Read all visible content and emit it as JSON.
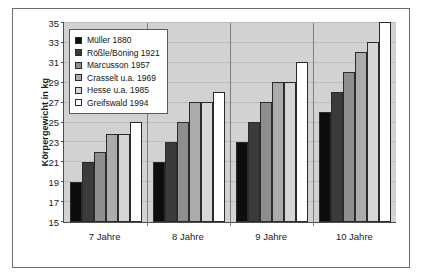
{
  "chart_data": {
    "type": "bar",
    "title": "",
    "xlabel": "",
    "ylabel": "Körpergewicht in kg",
    "ylim": [
      15,
      35
    ],
    "ytick_step": 2,
    "yticks": [
      35,
      33,
      31,
      29,
      27,
      25,
      23,
      21,
      19,
      17,
      15
    ],
    "grid": true,
    "legend_position": "top-left",
    "categories": [
      "7 Jahre",
      "8 Jahre",
      "9 Jahre",
      "10 Jahre"
    ],
    "series": [
      {
        "name": "Müller 1880",
        "color": "#0d0d0d",
        "values": [
          19,
          21,
          23,
          26
        ]
      },
      {
        "name": "Rößle/Böning 1921",
        "color": "#3b3b3b",
        "values": [
          21,
          23,
          25,
          28
        ]
      },
      {
        "name": "Marcusson 1957",
        "color": "#8e8e8e",
        "values": [
          22,
          25,
          27,
          30
        ]
      },
      {
        "name": "Crasselt u.a. 1969",
        "color": "#ababab",
        "values": [
          23.8,
          27,
          29,
          32
        ]
      },
      {
        "name": "Hesse u.a. 1985",
        "color": "#d6d6d6",
        "values": [
          23.8,
          27,
          29,
          33
        ]
      },
      {
        "name": "Greifswald 1994",
        "color": "#ffffff",
        "values": [
          25,
          28,
          31,
          35
        ]
      }
    ]
  }
}
